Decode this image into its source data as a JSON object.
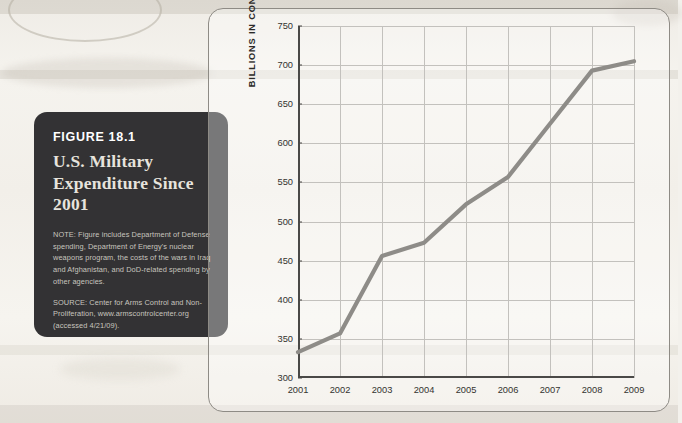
{
  "caption": {
    "figure_label": "FIGURE 18.1",
    "title": "U.S. Military Expenditure Since 2001",
    "note": "NOTE: Figure includes Department of Defense spending, Department of Energy's nuclear weapons program, the costs of the wars in Iraq and Afghanistan, and DoD-related spending by other agencies.",
    "source": "SOURCE: Center for Arms Control and Non-Proliferation, www.armscontrolcenter.org (accessed 4/21/09).",
    "background_color": "#333234",
    "text_color": "#c8c5bf"
  },
  "chart_data": {
    "type": "line",
    "title": "U.S. Military Expenditure Since 2001",
    "xlabel": "",
    "ylabel": "BILLIONS IN CONSTANT DOLLARS",
    "categories": [
      "2001",
      "2002",
      "2003",
      "2004",
      "2005",
      "2006",
      "2007",
      "2008",
      "2009"
    ],
    "values": [
      333,
      357,
      456,
      473,
      522,
      557,
      625,
      693,
      705
    ],
    "ylim": [
      300,
      750
    ],
    "ytick_labels": [
      "300",
      "350",
      "400",
      "450",
      "500",
      "550",
      "600",
      "650",
      "700",
      "750"
    ],
    "ytick_values": [
      300,
      350,
      400,
      450,
      500,
      550,
      600,
      650,
      700,
      750
    ],
    "ytick_step": 50,
    "grid": true,
    "legend": "none",
    "series": [
      {
        "name": "U.S. military expenditure",
        "values": [
          333,
          357,
          456,
          473,
          522,
          557,
          625,
          693,
          705
        ],
        "color": "#8e8c88",
        "line_width": 4.2
      }
    ]
  }
}
